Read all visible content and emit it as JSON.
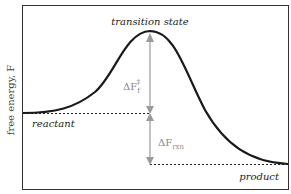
{
  "diagram": {
    "y_axis_label": "free energy, F",
    "labels": {
      "transition_state": "transition state",
      "reactant": "reactant",
      "product": "product"
    },
    "annotations": {
      "barrier": {
        "delta": "ΔF",
        "sub": "f",
        "sup": "‡"
      },
      "reaction": {
        "delta": "ΔF",
        "sub": "rxn"
      }
    },
    "colors": {
      "curve": "#1a1a1a",
      "arrow": "#9a9a9a",
      "frame": "#333333"
    }
  }
}
